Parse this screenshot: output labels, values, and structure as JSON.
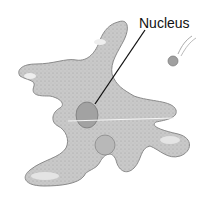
{
  "diagram": {
    "labels": [
      {
        "text": "Nucleus",
        "target": "nucleus"
      }
    ],
    "colors": {
      "cytoplasm": "#c8c8c8",
      "outline": "#8a8a8a",
      "nucleus": "#9a9a9a",
      "text": "#111111"
    }
  }
}
